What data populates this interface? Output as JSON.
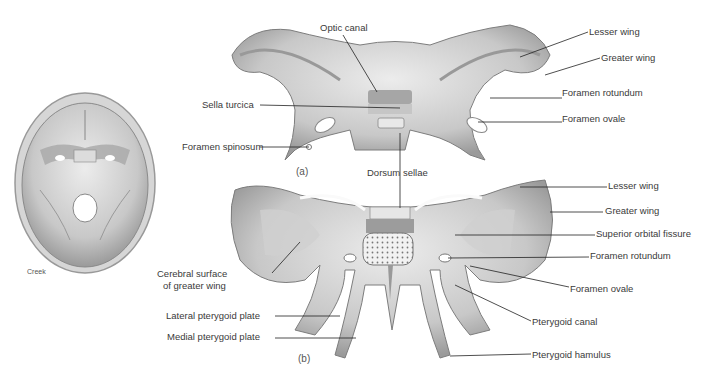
{
  "figure": {
    "skull_inset": {
      "credit": "Creek"
    },
    "panel_a": {
      "marker": "(a)",
      "labels": {
        "optic_canal": "Optic canal",
        "sella_turcica": "Sella turcica",
        "foramen_spinosum": "Foramen spinosum",
        "dorsum_sellae": "Dorsum sellae",
        "lesser_wing": "Lesser wing",
        "greater_wing": "Greater wing",
        "foramen_rotundum": "Foramen rotundum",
        "foramen_ovale": "Foramen ovale"
      }
    },
    "panel_b": {
      "marker": "(b)",
      "labels": {
        "lesser_wing": "Lesser wing",
        "greater_wing": "Greater wing",
        "superior_orbital_fissure": "Superior orbital fissure",
        "foramen_rotundum": "Foramen rotundum",
        "foramen_ovale": "Foramen ovale",
        "pterygoid_canal": "Pterygoid canal",
        "pterygoid_hamulus": "Pterygoid hamulus",
        "cerebral_surface_line1": "Cerebral surface",
        "cerebral_surface_line2": "of greater wing",
        "lateral_pterygoid_plate": "Lateral pterygoid plate",
        "medial_pterygoid_plate": "Medial pterygoid plate"
      }
    },
    "colors": {
      "bone_light": "#e4e4e4",
      "bone_mid": "#bdbdbd",
      "bone_dark": "#8a8a8a",
      "leader": "#222222"
    }
  }
}
